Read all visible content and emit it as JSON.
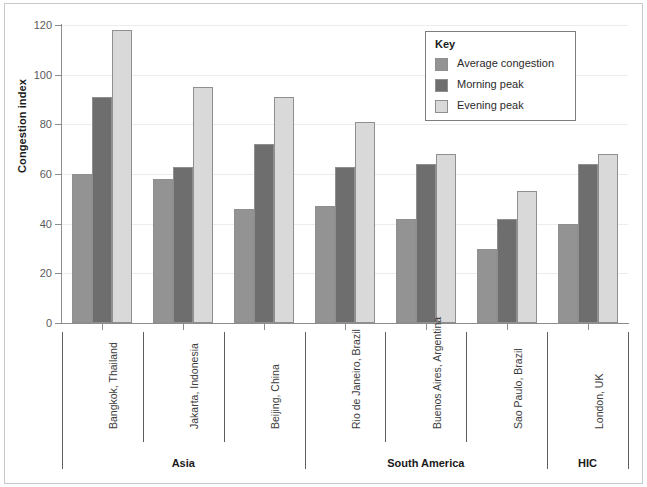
{
  "chart_data": {
    "type": "bar",
    "title": "",
    "xlabel": "",
    "ylabel": "Congestion index",
    "ylim": [
      0,
      120
    ],
    "yticks": [
      0,
      20,
      40,
      60,
      80,
      100,
      120
    ],
    "grid": true,
    "legend_position": "top-right",
    "legend_title": "Key",
    "categories": [
      "Bangkok, Thailand",
      "Jakarta, Indonesia",
      "Beijing, China",
      "Rio de Janeiro, Brazil",
      "Buenos Aires, Argentina",
      "Sao Paulo, Brazil",
      "London, UK"
    ],
    "series": [
      {
        "name": "Average congestion",
        "color": "#939393",
        "values": [
          60,
          58,
          46,
          47,
          42,
          30,
          40
        ]
      },
      {
        "name": "Morning peak",
        "color": "#6e6e6e",
        "values": [
          91,
          63,
          72,
          63,
          64,
          42,
          64
        ]
      },
      {
        "name": "Evening peak",
        "color": "#d9d9d9",
        "values": [
          118,
          95,
          91,
          81,
          68,
          53,
          68
        ]
      }
    ],
    "groups": [
      {
        "label": "Asia",
        "categories": [
          "Bangkok, Thailand",
          "Jakarta, Indonesia",
          "Beijing, China"
        ]
      },
      {
        "label": "South America",
        "categories": [
          "Rio de Janeiro, Brazil",
          "Buenos Aires, Argentina",
          "Sao Paulo, Brazil"
        ]
      },
      {
        "label": "HIC",
        "categories": [
          "London, UK"
        ]
      }
    ]
  },
  "colors": {
    "average_congestion": "#939393",
    "morning_peak": "#6e6e6e",
    "evening_peak": "#d9d9d9",
    "axis": "#8c8c8c",
    "gridline": "#ececed",
    "frame": "#c9c9c9"
  }
}
